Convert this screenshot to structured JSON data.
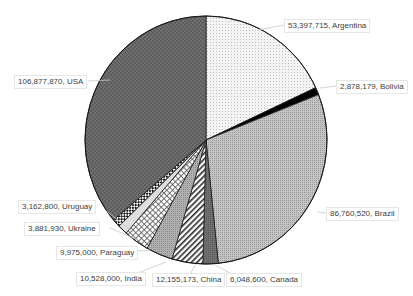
{
  "chart_data": {
    "type": "pie",
    "title": "",
    "start_angle_deg": 0,
    "direction": "clockwise",
    "slices": [
      {
        "label": "Argentina",
        "value": 53397715,
        "display": "53,397,715, Argentina",
        "pattern": "dots-light"
      },
      {
        "label": "Bolivia",
        "value": 2878179,
        "display": "2,878,179, Bolivia",
        "pattern": "solid-black"
      },
      {
        "label": "Brazil",
        "value": 86760520,
        "display": "86,760,520, Brazil",
        "pattern": "fine-gray"
      },
      {
        "label": "Canada",
        "value": 6048600,
        "display": "6,048,600, Canada",
        "pattern": "dark-gray"
      },
      {
        "label": "China",
        "value": 12155173,
        "display": "12,155,173, China",
        "pattern": "diagonal-stripes"
      },
      {
        "label": "India",
        "value": 10528000,
        "display": "10,528,000, India",
        "pattern": "medium-gray"
      },
      {
        "label": "Paraguay",
        "value": 9975000,
        "display": "9,975,000, Paraguay",
        "pattern": "grid"
      },
      {
        "label": "Ukraine",
        "value": 3881930,
        "display": "3,881,930, Ukraine",
        "pattern": "light-gray"
      },
      {
        "label": "Uruguay",
        "value": 3162800,
        "display": "3,162,800, Uruguay",
        "pattern": "checker"
      },
      {
        "label": "USA",
        "value": 106877870,
        "display": "106,877,870, USA",
        "pattern": "dark-checker"
      }
    ],
    "legend": "none",
    "data_labels": "value, category"
  },
  "labels": {
    "argentina": "53,397,715, Argentina",
    "bolivia": "2,878,179, Bolivia",
    "brazil": "86,760,520, Brazil",
    "canada": "6,048,600, Canada",
    "china": "12,155,173, China",
    "india": "10,528,000, India",
    "paraguay": "9,975,000, Paraguay",
    "ukraine": "3,881,930, Ukraine",
    "uruguay": "3,162,800, Uruguay",
    "usa": "106,877,870, USA"
  }
}
